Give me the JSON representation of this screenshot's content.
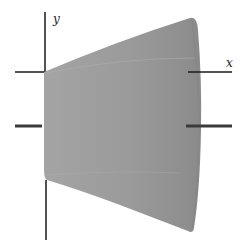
{
  "figure": {
    "type": "solid-of-revolution",
    "axes": {
      "x_label": "x",
      "y_label": "y"
    },
    "colors": {
      "solid_fill": "#9a9a9a",
      "solid_fill_dark": "#8a8a8a",
      "solid_edge_highlight": "#b8b8b8",
      "axis_color": "#1a1a1a",
      "rotation_axis_bar": "#3a3a3a",
      "background": "#ffffff"
    }
  }
}
